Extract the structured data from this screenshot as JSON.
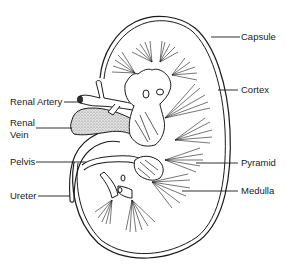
{
  "diagram": {
    "labels": {
      "capsule": "Capsule",
      "cortex": "Cortex",
      "renal_artery": "Renal Artery",
      "renal_vein_line1": "Renal",
      "renal_vein_line2": "Vein",
      "pelvis": "Pelvis",
      "pyramid": "Pyramid",
      "medulla": "Medulla",
      "ureter": "Ureter"
    },
    "colors": {
      "line": "#1a1a1a",
      "background": "#ffffff",
      "vein_fill": "#c8c8c8"
    }
  }
}
